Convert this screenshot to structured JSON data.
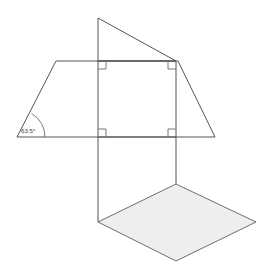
{
  "figure": {
    "background_color": "#ffffff",
    "stroke_color": "#555555",
    "shaded_fill_color": "#eeeeee",
    "shaded_stroke_color": "#6e6e6e",
    "angle_label": "63.5°",
    "angle_value": 63.5,
    "angle_unit": "degrees",
    "right_angle_marks_count": 4,
    "parts": {
      "trapezoid": {
        "name": "trapezoid-face",
        "points": "17,137 56,61 178,61 215,137"
      },
      "square": {
        "name": "square-face",
        "points": "98,61 176,61 176,137 98,137"
      },
      "apex_triangle": {
        "name": "apex-triangle-face",
        "points": "98,18 98,61 176,61"
      },
      "left_leg": {
        "name": "left-vertical-edge",
        "points": "98,137 98,222"
      },
      "right_leg": {
        "name": "right-vertical-edge",
        "points": "176,137 176,184"
      },
      "parallelogram": {
        "name": "shaded-parallelogram-base",
        "points": "98,222 176,184 256,222 176,261"
      }
    },
    "right_angle_marks": [
      {
        "name": "right-angle-top-left",
        "points": "98,69 106,69 106,61"
      },
      {
        "name": "right-angle-top-right",
        "points": "176,69 168,69 168,61"
      },
      {
        "name": "right-angle-bottom-left",
        "points": "98,129 106,129 106,137"
      },
      {
        "name": "right-angle-bottom-right",
        "points": "176,129 168,129 168,137"
      }
    ],
    "angle_arc": {
      "name": "angle-arc-63-5",
      "path": "M 45,137 A 28,28 0 0 0 31.5,113.5"
    },
    "angle_text_position": {
      "x": 21,
      "y": 133
    }
  }
}
